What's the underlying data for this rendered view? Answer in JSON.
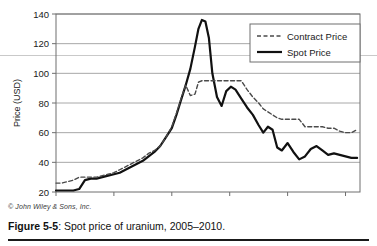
{
  "figure": {
    "copyright": "© John Wiley & Sons, Inc.",
    "caption_label": "Figure 5-5",
    "caption_text": ": Spot price of uranium, 2005–2010."
  },
  "colors": {
    "spot_line": "#111111",
    "contract_line": "#4a4a4a",
    "gridline": "#a8a8a8",
    "axis": "#6e6e6e",
    "background": "#ffffff",
    "text": "#1a1a1a"
  },
  "legend": {
    "position": "top-right",
    "entries": [
      {
        "label": "Contract Price",
        "style": "dashed"
      },
      {
        "label": "Spot Price",
        "style": "solid"
      }
    ]
  },
  "chart_data": {
    "type": "line",
    "title": "",
    "xlabel": "",
    "ylabel": "Price (USD)",
    "xlim": [
      2005.0,
      2010.25
    ],
    "ylim": [
      20,
      140
    ],
    "yticks": [
      20,
      40,
      60,
      80,
      100,
      120,
      140
    ],
    "xticks": [
      2005,
      2006,
      2007,
      2008,
      2009,
      2010
    ],
    "xtick_labels": [
      "2005",
      "2006",
      "2007",
      "2008",
      "2009",
      "2010"
    ],
    "ytick_labels": [
      "20",
      "40",
      "60",
      "80",
      "100",
      "120",
      "140"
    ],
    "grid": "horizontal",
    "legend_position": "top-right",
    "x": [
      2005.0,
      2005.1,
      2005.2,
      2005.3,
      2005.4,
      2005.5,
      2005.6,
      2005.7,
      2005.8,
      2005.9,
      2006.0,
      2006.1,
      2006.2,
      2006.3,
      2006.4,
      2006.5,
      2006.6,
      2006.7,
      2006.8,
      2006.9,
      2007.0,
      2007.08,
      2007.16,
      2007.24,
      2007.32,
      2007.4,
      2007.46,
      2007.52,
      2007.58,
      2007.64,
      2007.7,
      2007.78,
      2007.86,
      2007.94,
      2008.02,
      2008.1,
      2008.2,
      2008.3,
      2008.4,
      2008.5,
      2008.58,
      2008.66,
      2008.74,
      2008.82,
      2008.9,
      2009.0,
      2009.1,
      2009.2,
      2009.3,
      2009.4,
      2009.5,
      2009.6,
      2009.7,
      2009.8,
      2009.9,
      2010.0,
      2010.1,
      2010.2
    ],
    "series": [
      {
        "name": "Spot Price",
        "style": "solid",
        "color": "#111111",
        "values": [
          21,
          21,
          21,
          21,
          22,
          28,
          29,
          29,
          30,
          31,
          32,
          33,
          35,
          37,
          39,
          41,
          44,
          47,
          51,
          57,
          63,
          72,
          82,
          92,
          103,
          118,
          130,
          136,
          135,
          124,
          100,
          84,
          78,
          88,
          91,
          89,
          83,
          77,
          72,
          65,
          60,
          64,
          62,
          50,
          48,
          53,
          47,
          42,
          44,
          49,
          51,
          48,
          45,
          46,
          45,
          44,
          43,
          43
        ]
      },
      {
        "name": "Contract Price",
        "style": "dashed",
        "color": "#4a4a4a",
        "values": [
          26,
          26,
          27,
          28,
          30,
          30,
          30,
          30,
          31,
          32,
          33,
          35,
          37,
          39,
          41,
          43,
          46,
          48,
          51,
          57,
          64,
          73,
          83,
          92,
          85,
          86,
          94,
          95,
          95,
          95,
          95,
          95,
          95,
          95,
          95,
          95,
          95,
          89,
          84,
          80,
          76,
          74,
          72,
          70,
          69,
          69,
          69,
          69,
          64,
          64,
          64,
          64,
          63,
          63,
          61,
          60,
          60,
          62
        ]
      }
    ]
  }
}
